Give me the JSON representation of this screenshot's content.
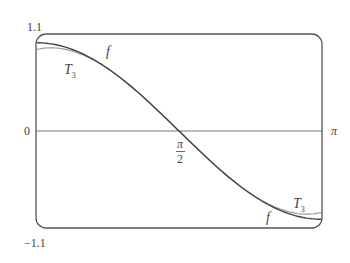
{
  "chart_data": {
    "type": "line",
    "title": "",
    "xlabel": "",
    "ylabel": "",
    "xlim": [
      0,
      3.14159
    ],
    "ylim": [
      -1.1,
      1.1
    ],
    "grid": false,
    "legend": "none (curves labeled inline)",
    "x_ticks": [
      {
        "value": 1.5708,
        "label": "π/2"
      },
      {
        "value": 3.14159,
        "label": "π"
      }
    ],
    "y_ticks": [
      {
        "value": 1.1,
        "label": "1.1"
      },
      {
        "value": 0,
        "label": "0"
      },
      {
        "value": -1.1,
        "label": "-1.1"
      }
    ],
    "series": [
      {
        "name": "f",
        "expression": "cos(x)",
        "x": [
          0,
          0.3927,
          0.7854,
          1.1781,
          1.5708,
          1.9635,
          2.3562,
          2.7489,
          3.14159
        ],
        "values": [
          1.0,
          0.924,
          0.707,
          0.383,
          0.0,
          -0.383,
          -0.707,
          -0.924,
          -1.0
        ]
      },
      {
        "name": "T3",
        "expression": "-(x-π/2) + (x-π/2)^3/6",
        "x": [
          0,
          0.3927,
          0.7854,
          1.1781,
          1.5708,
          1.9635,
          2.3562,
          2.7489,
          3.14159
        ],
        "values": [
          0.925,
          0.906,
          0.705,
          0.383,
          0.0,
          -0.383,
          -0.705,
          -0.906,
          -0.925
        ]
      }
    ],
    "annotations": [
      {
        "text": "f",
        "near": "upper-left curve"
      },
      {
        "text": "T3",
        "near": "upper-left curve"
      },
      {
        "text": "T3",
        "near": "lower-right curve"
      },
      {
        "text": "f",
        "near": "lower-right curve"
      }
    ]
  },
  "labels": {
    "y_top": "1.1",
    "y_zero": "0",
    "y_bottom": "−1.1",
    "x_pi": "π",
    "x_half_num": "π",
    "x_half_den": "2",
    "f_upper": "f",
    "t3_upper": "T",
    "t3_upper_sub": "3",
    "t3_lower": "T",
    "t3_lower_sub": "3",
    "f_lower": "f"
  },
  "colors": {
    "frame": "#555555",
    "axis": "#777777",
    "f_curve": "#444444",
    "t3_curve": "#999999"
  }
}
